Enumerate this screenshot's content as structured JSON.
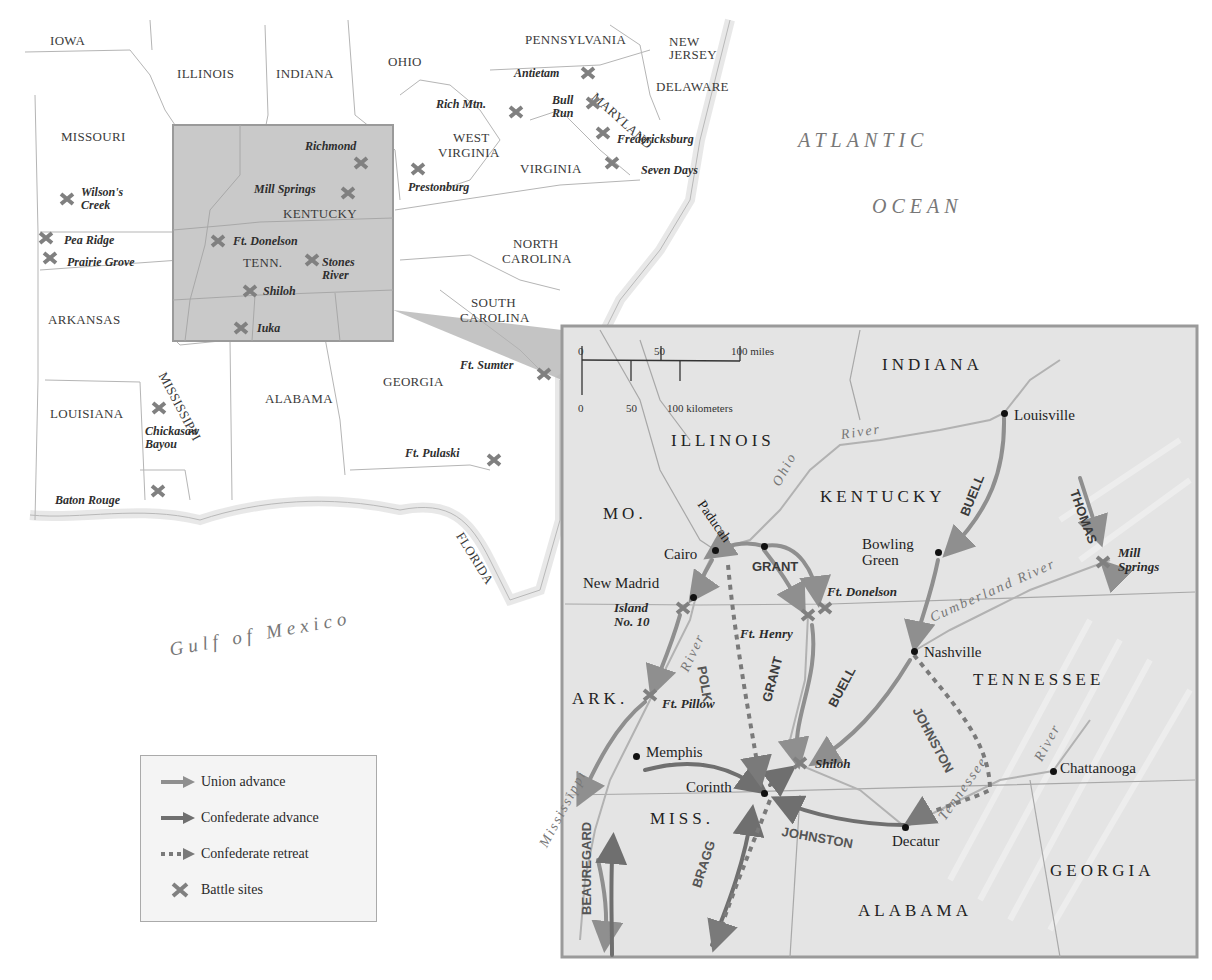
{
  "overview_map": {
    "states": [
      {
        "name": "IOWA",
        "x": 50,
        "y": 34
      },
      {
        "name": "ILLINOIS",
        "x": 177,
        "y": 67
      },
      {
        "name": "INDIANA",
        "x": 276,
        "y": 67
      },
      {
        "name": "OHIO",
        "x": 388,
        "y": 55
      },
      {
        "name": "PENNSYLVANIA",
        "x": 525,
        "y": 33
      },
      {
        "name": "NEW",
        "x": 669,
        "y": 35
      },
      {
        "name": "JERSEY",
        "x": 669,
        "y": 48
      },
      {
        "name": "DELAWARE",
        "x": 656,
        "y": 80
      },
      {
        "name": "MISSOURI",
        "x": 61,
        "y": 130
      },
      {
        "name": "WEST",
        "x": 453,
        "y": 131
      },
      {
        "name": "VIRGINIA",
        "x": 438,
        "y": 146
      },
      {
        "name": "VIRGINIA",
        "x": 520,
        "y": 162
      },
      {
        "name": "KENTUCKY",
        "x": 283,
        "y": 207
      },
      {
        "name": "TENN.",
        "x": 243,
        "y": 256
      },
      {
        "name": "NORTH",
        "x": 513,
        "y": 237
      },
      {
        "name": "CAROLINA",
        "x": 502,
        "y": 252
      },
      {
        "name": "SOUTH",
        "x": 471,
        "y": 296
      },
      {
        "name": "CAROLINA",
        "x": 460,
        "y": 311
      },
      {
        "name": "ARKANSAS",
        "x": 48,
        "y": 313
      },
      {
        "name": "GEORGIA",
        "x": 383,
        "y": 375
      },
      {
        "name": "ALABAMA",
        "x": 265,
        "y": 392
      },
      {
        "name": "LOUISIANA",
        "x": 50,
        "y": 407
      }
    ],
    "rotated_states": [
      {
        "name": "MISSISSIPPI",
        "x": 168,
        "y": 370,
        "rotate": 62
      },
      {
        "name": "MARYLAND",
        "x": 598,
        "y": 90,
        "rotate": 42
      },
      {
        "name": "FLORIDA",
        "x": 465,
        "y": 530,
        "rotate": 58
      }
    ],
    "battles": [
      {
        "name": "Richmond",
        "label_x": 305,
        "label_y": 140,
        "x": 361,
        "y": 163
      },
      {
        "name": "Mill Springs",
        "label_x": 254,
        "label_y": 183,
        "x": 348,
        "y": 193
      },
      {
        "name": "Ft. Donelson",
        "label_x": 233,
        "label_y": 235,
        "x": 218,
        "y": 241
      },
      {
        "name": "Stones\nRiver",
        "label_x": 322,
        "label_y": 256,
        "x": 312,
        "y": 260
      },
      {
        "name": "Shiloh",
        "label_x": 263,
        "label_y": 285,
        "x": 250,
        "y": 291
      },
      {
        "name": "Iuka",
        "label_x": 257,
        "label_y": 322,
        "x": 241,
        "y": 328
      },
      {
        "name": "Wilson's\nCreek",
        "label_x": 81,
        "label_y": 186,
        "x": 67,
        "y": 199
      },
      {
        "name": "Pea Ridge",
        "label_x": 64,
        "label_y": 234,
        "x": 46,
        "y": 238
      },
      {
        "name": "Prairie Grove",
        "label_x": 67,
        "label_y": 256,
        "x": 50,
        "y": 258
      },
      {
        "name": "Rich Mtn.",
        "label_x": 436,
        "label_y": 98,
        "x": 516,
        "y": 112
      },
      {
        "name": "Antietam",
        "label_x": 514,
        "label_y": 67,
        "x": 588,
        "y": 73
      },
      {
        "name": "Bull\nRun",
        "label_x": 552,
        "label_y": 94,
        "x": 593,
        "y": 103
      },
      {
        "name": "Fredericksburg",
        "label_x": 617,
        "label_y": 133,
        "x": 603,
        "y": 133
      },
      {
        "name": "Seven Days",
        "label_x": 641,
        "label_y": 164,
        "x": 612,
        "y": 163
      },
      {
        "name": "Prestonburg",
        "label_x": 408,
        "label_y": 181,
        "x": 418,
        "y": 169
      },
      {
        "name": "Ft. Sumter",
        "label_x": 460,
        "label_y": 359,
        "x": 544,
        "y": 374
      },
      {
        "name": "Chickasaw\nBayou",
        "label_x": 145,
        "label_y": 425,
        "x": 159,
        "y": 408
      },
      {
        "name": "Ft. Pulaski",
        "label_x": 405,
        "label_y": 447,
        "x": 494,
        "y": 460
      },
      {
        "name": "Baton Rouge",
        "label_x": 55,
        "label_y": 494,
        "x": 158,
        "y": 491
      }
    ],
    "oceans": [
      {
        "name": "ATLANTIC",
        "x": 798,
        "y": 130
      },
      {
        "name": "OCEAN",
        "x": 872,
        "y": 196
      }
    ],
    "gulf": {
      "name": "Gulf  of  Mexico",
      "x": 168,
      "y": 640,
      "rotate": -10
    }
  },
  "inset_map": {
    "states": [
      {
        "name": "INDIANA",
        "x": 882,
        "y": 356
      },
      {
        "name": "ILLINOIS",
        "x": 671,
        "y": 432
      },
      {
        "name": "KENTUCKY",
        "x": 820,
        "y": 488
      },
      {
        "name": "MO.",
        "x": 603,
        "y": 505
      },
      {
        "name": "TENNESSEE",
        "x": 973,
        "y": 671
      },
      {
        "name": "ARK.",
        "x": 572,
        "y": 690
      },
      {
        "name": "MISS.",
        "x": 650,
        "y": 810
      },
      {
        "name": "ALABAMA",
        "x": 858,
        "y": 902
      },
      {
        "name": "GEORGIA",
        "x": 1050,
        "y": 862
      }
    ],
    "cities": [
      {
        "name": "Louisville",
        "x": 1004,
        "y": 413,
        "label_x": 1014,
        "label_y": 408
      },
      {
        "name": "Bowling\nGreen",
        "label_x": 862,
        "label_y": 537,
        "x": 938,
        "y": 552
      },
      {
        "name": "Cairo",
        "x": 715,
        "y": 550,
        "label_x": 664,
        "label_y": 547
      },
      {
        "name": "Paducah",
        "x": 764,
        "y": 546
      },
      {
        "name": "New Madrid",
        "x": 693,
        "y": 597,
        "label_x": 583,
        "label_y": 576
      },
      {
        "name": "Nashville",
        "x": 914,
        "y": 651,
        "label_x": 924,
        "label_y": 645
      },
      {
        "name": "Memphis",
        "x": 636,
        "y": 756,
        "label_x": 646,
        "label_y": 745
      },
      {
        "name": "Corinth",
        "x": 764,
        "y": 793,
        "label_x": 686,
        "label_y": 780
      },
      {
        "name": "Decatur",
        "x": 905,
        "y": 827,
        "label_x": 892,
        "label_y": 834
      },
      {
        "name": "Chattanooga",
        "x": 1053,
        "y": 771,
        "label_x": 1060,
        "label_y": 761
      }
    ],
    "battles": [
      {
        "name": "Island\nNo. 10",
        "label_x": 614,
        "label_y": 601,
        "x": 683,
        "y": 608
      },
      {
        "name": "Ft. Donelson",
        "label_x": 827,
        "label_y": 585,
        "x": 825,
        "y": 608
      },
      {
        "name": "Ft. Henry",
        "label_x": 740,
        "label_y": 627,
        "x": 808,
        "y": 615
      },
      {
        "name": "Ft. Pillow",
        "label_x": 662,
        "label_y": 697,
        "x": 650,
        "y": 695
      },
      {
        "name": "Shiloh",
        "label_x": 815,
        "label_y": 757,
        "x": 800,
        "y": 763
      },
      {
        "name": "Mill\nSprings",
        "label_x": 1118,
        "label_y": 546,
        "x": 1103,
        "y": 562
      }
    ],
    "rivers": [
      {
        "name": "River",
        "x": 840,
        "y": 428,
        "rotate": -8
      },
      {
        "name": "Ohio",
        "x": 770,
        "y": 482,
        "rotate": -62
      },
      {
        "name": "Cumberland River",
        "x": 928,
        "y": 612,
        "rotate": -24
      },
      {
        "name": "River",
        "x": 678,
        "y": 668,
        "rotate": -65
      },
      {
        "name": "Mississippi",
        "x": 537,
        "y": 843,
        "rotate": -62
      },
      {
        "name": "Tennessee",
        "x": 936,
        "y": 815,
        "rotate": -55
      },
      {
        "name": "River",
        "x": 1032,
        "y": 757,
        "rotate": -62
      }
    ],
    "paducah_label": {
      "name": "Paducah",
      "x": 706,
      "y": 498,
      "rotate": 55
    },
    "generals": [
      {
        "name": "GRANT",
        "x": 752,
        "y": 560,
        "rotate": 0,
        "union": true
      },
      {
        "name": "GRANT",
        "x": 760,
        "y": 700,
        "rotate": -75,
        "union": true
      },
      {
        "name": "BUELL",
        "x": 958,
        "y": 513,
        "rotate": -68,
        "union": true
      },
      {
        "name": "BUELL",
        "x": 826,
        "y": 703,
        "rotate": -62,
        "union": true
      },
      {
        "name": "THOMAS",
        "x": 1080,
        "y": 488,
        "rotate": 70,
        "union": true
      },
      {
        "name": "POLK",
        "x": 708,
        "y": 665,
        "rotate": 80,
        "union": false
      },
      {
        "name": "JOHNSTON",
        "x": 922,
        "y": 705,
        "rotate": 62,
        "union": false
      },
      {
        "name": "JOHNSTON",
        "x": 783,
        "y": 825,
        "rotate": 10,
        "union": false
      },
      {
        "name": "BRAGG",
        "x": 690,
        "y": 885,
        "rotate": -72,
        "union": false
      },
      {
        "name": "BEAUREGARD",
        "x": 580,
        "y": 915,
        "rotate": -90,
        "union": false
      }
    ],
    "scale": {
      "miles": [
        "0",
        "50",
        "100 miles"
      ],
      "kilometers": [
        "0",
        "50",
        "100 kilometers"
      ]
    }
  },
  "legend": {
    "items": [
      {
        "label": "Union advance",
        "type": "union"
      },
      {
        "label": "Confederate advance",
        "type": "confederate"
      },
      {
        "label": "Confederate retreat",
        "type": "retreat"
      },
      {
        "label": "Battle sites",
        "type": "battle"
      }
    ]
  },
  "colors": {
    "union": "#8f8f8f",
    "confederate": "#6f6f6f",
    "retreat": "#7a7a7a",
    "battle": "#808080",
    "inset_bg": "#e2e2e2",
    "highlight_box": "#c9c9c9",
    "border": "#9a9a9a",
    "land": "#ffffff",
    "water": "#ffffff",
    "boundary": "#b5b5b5"
  }
}
